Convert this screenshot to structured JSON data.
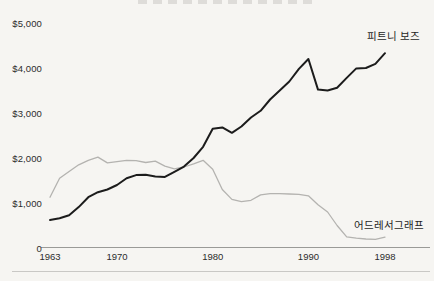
{
  "page": {
    "background_color": "#f6f5f2"
  },
  "chart_data": {
    "type": "line",
    "x": [
      1963,
      1964,
      1965,
      1966,
      1967,
      1968,
      1969,
      1970,
      1971,
      1972,
      1973,
      1974,
      1975,
      1976,
      1977,
      1978,
      1979,
      1980,
      1981,
      1982,
      1983,
      1984,
      1985,
      1986,
      1987,
      1988,
      1989,
      1990,
      1991,
      1992,
      1993,
      1994,
      1995,
      1996,
      1997,
      1998
    ],
    "series": [
      {
        "name": "피트니 보즈",
        "color": "#1c1c1c",
        "stroke_width": 2,
        "values": [
          620,
          660,
          730,
          910,
          1130,
          1240,
          1300,
          1400,
          1550,
          1620,
          1630,
          1590,
          1580,
          1690,
          1810,
          2000,
          2250,
          2650,
          2680,
          2560,
          2700,
          2900,
          3050,
          3300,
          3500,
          3700,
          3980,
          4200,
          3520,
          3500,
          3560,
          3780,
          3990,
          4000,
          4090,
          4330
        ]
      },
      {
        "name": "어드레서그래프",
        "color": "#b4b3b0",
        "stroke_width": 1.3,
        "values": [
          1130,
          1550,
          1700,
          1850,
          1950,
          2020,
          1890,
          1920,
          1950,
          1940,
          1900,
          1930,
          1820,
          1760,
          1800,
          1870,
          1950,
          1750,
          1300,
          1080,
          1030,
          1060,
          1180,
          1210,
          1210,
          1200,
          1190,
          1160,
          960,
          800,
          500,
          250,
          220,
          200,
          190,
          240
        ]
      }
    ],
    "yticks": [
      {
        "label": "$5,000",
        "value": 5000
      },
      {
        "label": "$4,000",
        "value": 4000
      },
      {
        "label": "$3,000",
        "value": 3000
      },
      {
        "label": "$2,000",
        "value": 2000
      },
      {
        "label": "$1,000",
        "value": 1000
      },
      {
        "label": "0",
        "value": 0
      }
    ],
    "xticks": [
      {
        "label": "1963",
        "year": 1963
      },
      {
        "label": "1970",
        "year": 1970
      },
      {
        "label": "1980",
        "year": 1980
      },
      {
        "label": "1990",
        "year": 1990
      },
      {
        "label": "1998",
        "year": 1998
      }
    ],
    "xlim": [
      1963,
      1998
    ],
    "ylim": [
      0,
      5000
    ],
    "grid": false,
    "legend_position": "inline-end-of-line",
    "axis_color": "#9a9a97",
    "divider_color": "#c9c8c5"
  }
}
